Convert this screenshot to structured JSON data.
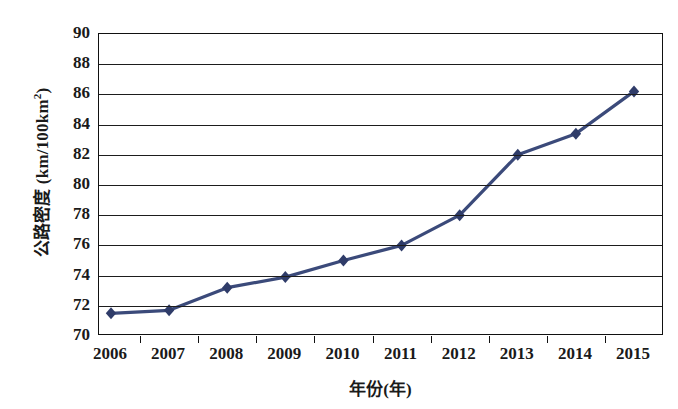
{
  "chart_data": {
    "type": "line",
    "title": "",
    "xlabel": "年份(年)",
    "ylabel": "公路密度 (km/100km²)",
    "ylabel_main": "公路密度 (km/100km",
    "ylabel_sup": "2",
    "ylabel_tail": ")",
    "categories": [
      "2006",
      "2007",
      "2008",
      "2009",
      "2010",
      "2011",
      "2012",
      "2013",
      "2014",
      "2015"
    ],
    "values": [
      71.5,
      71.7,
      73.2,
      73.9,
      75.0,
      76.0,
      78.0,
      82.0,
      83.4,
      86.2
    ],
    "series": [
      {
        "name": "公路密度",
        "values": [
          71.5,
          71.7,
          73.2,
          73.9,
          75.0,
          76.0,
          78.0,
          82.0,
          83.4,
          86.2
        ]
      }
    ],
    "ylim": [
      70,
      90
    ],
    "yticks": [
      70,
      72,
      74,
      76,
      78,
      80,
      82,
      84,
      86,
      88,
      90
    ],
    "ytick_labels": [
      "70",
      "72",
      "74",
      "76",
      "78",
      "80",
      "82",
      "84",
      "86",
      "88",
      "90"
    ],
    "grid": true,
    "legend": "none",
    "marker": "diamond",
    "line_color": "#3b4a7a",
    "marker_color": "#2f3c69",
    "axis_color": "#111111",
    "grid_color": "#1d1d1d",
    "background": "#ffffff"
  }
}
